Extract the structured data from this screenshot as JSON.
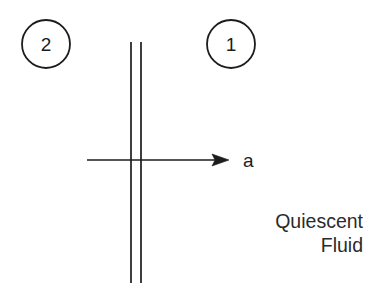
{
  "diagram": {
    "background_color": "#ffffff",
    "stroke_color": "#1d1d1d",
    "text_color": "#2b2b2b",
    "regions": [
      {
        "id": "region-2",
        "label": "2",
        "shape": "circle",
        "cx": 46,
        "cy": 44,
        "r": 24
      },
      {
        "id": "region-1",
        "label": "1",
        "shape": "circle",
        "cx": 231,
        "cy": 44,
        "r": 24
      }
    ],
    "interface": {
      "name": "vertical-double-line",
      "x_left": 131,
      "x_right": 141,
      "y_top": 42,
      "y_bottom": 283,
      "line_width": 1.6
    },
    "arrow": {
      "name": "acceleration-arrow",
      "label": "a",
      "x_start": 87,
      "x_end": 229,
      "y": 160,
      "label_x": 243,
      "label_y": 167
    },
    "annotation": {
      "line1": "Quiescent",
      "line2": "Fluid",
      "line1_x": 363,
      "line1_y": 228,
      "line2_x": 363,
      "line2_y": 252,
      "align": "right"
    }
  }
}
